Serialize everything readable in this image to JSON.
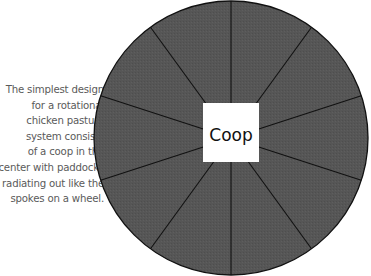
{
  "caption": {
    "lines": [
      "The simplest design",
      "for a rotational",
      "chicken pasture",
      "system consists",
      "of a coop in the",
      "center with paddocks",
      "radiating out like the",
      "spokes on a wheel."
    ]
  },
  "diagram": {
    "center_label": "Coop",
    "paddock_count": 10,
    "paddock_color": "#555555",
    "coop_color": "#ffffff",
    "line_color": "#111111"
  }
}
